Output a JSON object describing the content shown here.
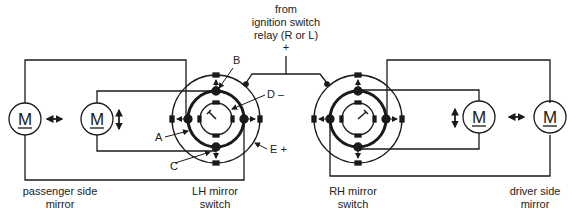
{
  "supply": {
    "line1": "from",
    "line2": "ignition switch",
    "line3": "relay (R or L)",
    "polarity": "+"
  },
  "switches": [
    {
      "id": "lh",
      "label_line1": "LH mirror",
      "label_line2": "switch"
    },
    {
      "id": "rh",
      "label_line1": "RH mirror",
      "label_line2": "switch"
    }
  ],
  "mirrors": [
    {
      "id": "passenger",
      "label_line1": "passenger side",
      "label_line2": "mirror"
    },
    {
      "id": "driver",
      "label_line1": "driver side",
      "label_line2": "mirror"
    }
  ],
  "motors": [
    {
      "id": "passenger-horizontal",
      "symbol": "M",
      "motion": "horizontal"
    },
    {
      "id": "passenger-vertical",
      "symbol": "M",
      "motion": "vertical"
    },
    {
      "id": "driver-vertical",
      "symbol": "M",
      "motion": "vertical"
    },
    {
      "id": "driver-horizontal",
      "symbol": "M",
      "motion": "horizontal"
    }
  ],
  "callouts": {
    "A": "A",
    "B": "B",
    "C": "C",
    "D": "D –",
    "E": "E +"
  },
  "colors": {
    "line": "#1a1a1a",
    "background": "#ffffff"
  }
}
